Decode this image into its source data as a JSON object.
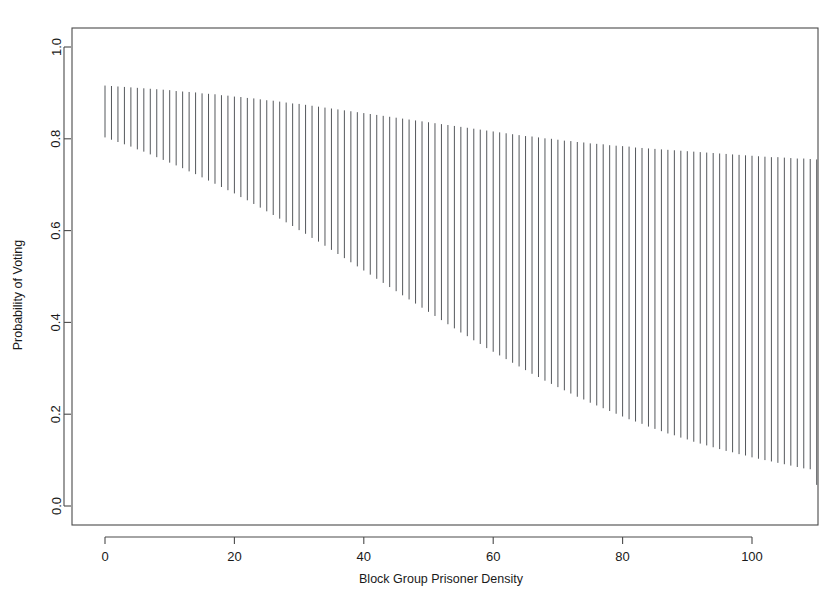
{
  "figure": {
    "background": "#ffffff",
    "ink_color": "#4a4a4a",
    "bar_color": "#55585c",
    "width": 831,
    "height": 611
  },
  "axes": {
    "x_title": "Block Group Prisoner Density",
    "y_title": "Probability of Voting",
    "x_ticks": [
      "0",
      "20",
      "40",
      "60",
      "80",
      "100"
    ],
    "y_ticks": [
      "0.0",
      "0.2",
      "0.4",
      "0.6",
      "0.8",
      "1.0"
    ]
  },
  "chart_data": {
    "type": "bar",
    "title": "",
    "subtitle": "",
    "xlabel": "Block Group Prisoner Density",
    "ylabel": "Probability of Voting",
    "xlim": [
      -5,
      114
    ],
    "ylim": [
      -0.04,
      1.06
    ],
    "xticks": [
      0,
      20,
      40,
      60,
      80,
      100
    ],
    "yticks": [
      0.0,
      0.2,
      0.4,
      0.6,
      0.8,
      1.0
    ],
    "grid": false,
    "legend": null,
    "annotations": [],
    "x": [
      0,
      1,
      2,
      3,
      4,
      5,
      6,
      7,
      8,
      9,
      10,
      11,
      12,
      13,
      14,
      15,
      16,
      17,
      18,
      19,
      20,
      21,
      22,
      23,
      24,
      25,
      26,
      27,
      28,
      29,
      30,
      31,
      32,
      33,
      34,
      35,
      36,
      37,
      38,
      39,
      40,
      41,
      42,
      43,
      44,
      45,
      46,
      47,
      48,
      49,
      50,
      51,
      52,
      53,
      54,
      55,
      56,
      57,
      58,
      59,
      60,
      61,
      62,
      63,
      64,
      65,
      66,
      67,
      68,
      69,
      70,
      71,
      72,
      73,
      74,
      75,
      76,
      77,
      78,
      79,
      80,
      81,
      82,
      83,
      84,
      85,
      86,
      87,
      88,
      89,
      90,
      91,
      92,
      93,
      94,
      95,
      96,
      97,
      98,
      99,
      100,
      101,
      102,
      103,
      104,
      105,
      106,
      107,
      108,
      109,
      110
    ],
    "series": [
      {
        "name": "Upper confidence bound",
        "values": [
          0.916,
          0.915,
          0.914,
          0.913,
          0.912,
          0.911,
          0.91,
          0.909,
          0.908,
          0.907,
          0.906,
          0.904,
          0.903,
          0.902,
          0.901,
          0.899,
          0.898,
          0.897,
          0.895,
          0.894,
          0.892,
          0.891,
          0.889,
          0.888,
          0.886,
          0.884,
          0.883,
          0.881,
          0.879,
          0.877,
          0.876,
          0.874,
          0.872,
          0.87,
          0.868,
          0.866,
          0.864,
          0.862,
          0.86,
          0.858,
          0.856,
          0.854,
          0.852,
          0.85,
          0.848,
          0.846,
          0.844,
          0.842,
          0.84,
          0.838,
          0.836,
          0.834,
          0.832,
          0.83,
          0.828,
          0.826,
          0.824,
          0.822,
          0.82,
          0.818,
          0.816,
          0.814,
          0.812,
          0.81,
          0.808,
          0.806,
          0.805,
          0.803,
          0.801,
          0.8,
          0.798,
          0.796,
          0.795,
          0.793,
          0.792,
          0.79,
          0.789,
          0.788,
          0.786,
          0.785,
          0.784,
          0.783,
          0.781,
          0.78,
          0.779,
          0.778,
          0.777,
          0.776,
          0.775,
          0.774,
          0.773,
          0.772,
          0.771,
          0.77,
          0.769,
          0.768,
          0.767,
          0.766,
          0.765,
          0.764,
          0.763,
          0.762,
          0.761,
          0.76,
          0.76,
          0.759,
          0.758,
          0.757,
          0.757,
          0.756,
          0.755
        ]
      },
      {
        "name": "Lower confidence bound",
        "values": [
          0.803,
          0.798,
          0.793,
          0.788,
          0.783,
          0.777,
          0.772,
          0.766,
          0.76,
          0.754,
          0.748,
          0.742,
          0.736,
          0.729,
          0.723,
          0.716,
          0.709,
          0.702,
          0.695,
          0.688,
          0.681,
          0.673,
          0.666,
          0.658,
          0.65,
          0.642,
          0.634,
          0.626,
          0.618,
          0.61,
          0.601,
          0.593,
          0.584,
          0.576,
          0.567,
          0.558,
          0.549,
          0.54,
          0.531,
          0.522,
          0.513,
          0.504,
          0.495,
          0.486,
          0.477,
          0.468,
          0.459,
          0.45,
          0.441,
          0.432,
          0.423,
          0.414,
          0.405,
          0.396,
          0.387,
          0.378,
          0.37,
          0.361,
          0.353,
          0.344,
          0.336,
          0.328,
          0.32,
          0.312,
          0.304,
          0.296,
          0.288,
          0.281,
          0.273,
          0.266,
          0.259,
          0.252,
          0.245,
          0.238,
          0.232,
          0.225,
          0.219,
          0.213,
          0.207,
          0.201,
          0.195,
          0.189,
          0.184,
          0.179,
          0.173,
          0.168,
          0.163,
          0.158,
          0.154,
          0.149,
          0.145,
          0.14,
          0.136,
          0.132,
          0.128,
          0.124,
          0.12,
          0.117,
          0.113,
          0.11,
          0.106,
          0.103,
          0.1,
          0.097,
          0.094,
          0.091,
          0.088,
          0.085,
          0.082,
          0.08,
          0.046
        ]
      }
    ]
  }
}
